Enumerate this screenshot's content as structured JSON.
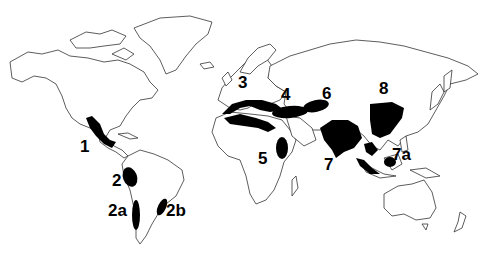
{
  "map": {
    "type": "world outline map",
    "fill_color": "#000000",
    "background": "#ffffff",
    "regions": [
      {
        "id": "1",
        "label": "1",
        "location": "Mexico / Central America"
      },
      {
        "id": "2",
        "label": "2",
        "location": "Andes (Peru / Ecuador / Bolivia)"
      },
      {
        "id": "2a",
        "label": "2a",
        "location": "Chile"
      },
      {
        "id": "2b",
        "label": "2b",
        "location": "Southern Brazil / Paraguay"
      },
      {
        "id": "3",
        "label": "3",
        "location": "Mediterranean"
      },
      {
        "id": "4",
        "label": "4",
        "location": "Near East / Asia Minor"
      },
      {
        "id": "5",
        "label": "5",
        "location": "Ethiopia"
      },
      {
        "id": "6",
        "label": "6",
        "location": "Central Asia"
      },
      {
        "id": "7",
        "label": "7",
        "location": "India / Indo-Burma"
      },
      {
        "id": "7a",
        "label": "7a",
        "location": "Indo-Malaya"
      },
      {
        "id": "8",
        "label": "8",
        "location": "China"
      }
    ]
  }
}
